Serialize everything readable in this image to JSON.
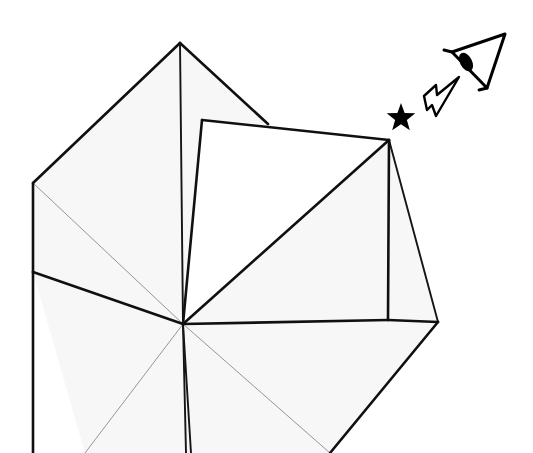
{
  "figure": {
    "kind": "origami-diagram",
    "background_color": "#ffffff",
    "paper_fill_color": "#f7f7f7",
    "paper_white_face_color": "#ffffff",
    "line_color": "#101010",
    "soft_crease_color": "#a6a6a6",
    "canvas": {
      "width": 533,
      "height": 453
    }
  },
  "symbols": {
    "view_eye": {
      "name": "eye-symbol",
      "meaning": "view from this direction",
      "color": "#000000",
      "triangle_points": "505,34 487,88 452,52",
      "lash_line": "452,52 444,50",
      "tail_line": "487,88 479,90",
      "pupil": {
        "cx": 466,
        "cy": 62,
        "rx": 6,
        "ry": 10,
        "rotation": -28
      }
    },
    "motion_arrow": {
      "name": "arrow-symbol",
      "meaning": "fold/move direction",
      "color": "#000000",
      "outline_points": "459,77 437,95 436,85 424,96 427,110 432,105 436,116"
    },
    "star": {
      "name": "star-symbol",
      "meaning": "reference marker",
      "color": "#000000",
      "center_x": 401,
      "center_y": 118,
      "outer_radius": 15,
      "inner_radius": 6.2,
      "points": 5
    }
  },
  "geometry": {
    "center_point": {
      "x": 183,
      "y": 324
    },
    "apex_point": {
      "x": 180,
      "y": 43
    },
    "left_corner": {
      "x": 33,
      "y": 183
    },
    "right_corner": {
      "x": 438,
      "y": 322
    },
    "white_flap_corners": [
      {
        "x": 202,
        "y": 120
      },
      {
        "x": 389,
        "y": 140
      },
      {
        "x": 388,
        "y": 320
      }
    ]
  },
  "faces": [
    {
      "name": "upper-left-face",
      "fill": "#f7f7f7",
      "points": "180,43 33,183 33,272 183,324"
    },
    {
      "name": "upper-right-face",
      "fill": "#f7f7f7",
      "points": "180,43 268,124 202,120 183,324"
    },
    {
      "name": "right-wing-face",
      "fill": "#f7f7f7",
      "points": "183,324 389,140 438,322 330,453 183,453"
    },
    {
      "name": "lower-left-face",
      "fill": "#f7f7f7",
      "points": "33,272 183,324 186,453 85,453"
    },
    {
      "name": "lower-middle-face",
      "fill": "#f7f7f7",
      "points": "183,324 186,453 330,453"
    },
    {
      "name": "white-raised-flap",
      "fill": "#ffffff",
      "points": "202,120 389,140 183,324"
    }
  ],
  "edges": {
    "heavy": [
      "180,43 33,183",
      "180,43 268,124",
      "202,120 389,140",
      "389,140 183,324",
      "183,324 388,320",
      "389,140 388,320",
      "388,320 438,322",
      "438,322 330,453",
      "183,324 33,272",
      "33,272 33,453",
      "33,183 33,272",
      "202,120 183,324"
    ],
    "medium": [
      "180,43 183,324",
      "183,324 186,453",
      "183,324 191,453",
      "389,140 438,322"
    ],
    "thin": [
      "33,183 183,324",
      "183,324 85,453",
      "183,324 330,453"
    ]
  },
  "labels": {
    "caption": "",
    "step_number": ""
  }
}
